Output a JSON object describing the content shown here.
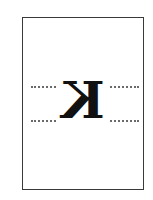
{
  "figure": {
    "letter": "K",
    "mirrored": true,
    "guide_lines": [
      "dotted-top",
      "dotted-bottom"
    ],
    "colors": {
      "frame": "#3a3a3a",
      "letter": "#111111",
      "dots": "#6a6a6a"
    }
  }
}
